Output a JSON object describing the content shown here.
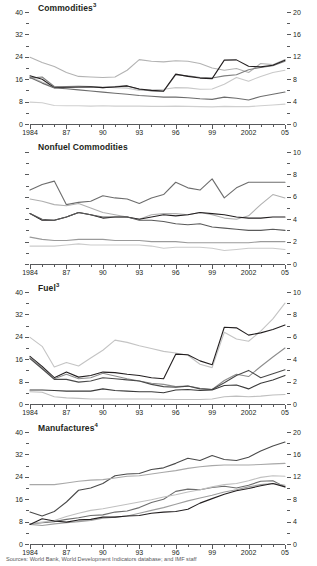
{
  "figure": {
    "source": "Sources: World Bank, World Development Indicators database; and IMF staff"
  },
  "xaxis": {
    "labels": [
      "1984",
      "87",
      "90",
      "93",
      "96",
      "99",
      "2002",
      "05"
    ],
    "label_years": [
      1984,
      1987,
      1990,
      1993,
      1996,
      1999,
      2002,
      2005
    ],
    "min": 1984,
    "max": 2005
  },
  "chart_data": [
    {
      "type": "line",
      "title": "Commodities",
      "title_superscript": "3",
      "xlabel": "",
      "ylabel_left": "",
      "ylabel_right": "",
      "x": [
        1984,
        1985,
        1986,
        1987,
        1988,
        1989,
        1990,
        1991,
        1992,
        1993,
        1994,
        1995,
        1996,
        1997,
        1998,
        1999,
        2000,
        2001,
        2002,
        2003,
        2004,
        2005
      ],
      "ylim_left": [
        0,
        40
      ],
      "yticks_left": [
        0,
        8,
        16,
        24,
        32,
        40
      ],
      "ylim_right": [
        0,
        20
      ],
      "yticks_right": [
        0,
        4,
        8,
        12,
        16,
        20
      ],
      "grid": false,
      "legend": "none",
      "series": [
        {
          "name": "series-1",
          "color": "#b3b3b3",
          "axis": "left",
          "values": [
            23.8,
            22.0,
            20.5,
            18.4,
            17.0,
            16.8,
            16.6,
            16.8,
            19.2,
            23.0,
            22.4,
            22.2,
            22.6,
            22.4,
            21.6,
            20.0,
            19.2,
            19.8,
            18.4,
            21.6,
            21.2,
            23.0
          ]
        },
        {
          "name": "series-2",
          "color": "#c9c9c9",
          "axis": "left",
          "values": [
            17.0,
            15.0,
            13.2,
            13.4,
            13.6,
            13.4,
            13.2,
            13.0,
            12.8,
            12.0,
            12.2,
            12.4,
            13.0,
            12.9,
            12.4,
            12.5,
            14.2,
            16.6,
            15.3,
            17.0,
            18.4,
            19.2
          ]
        },
        {
          "name": "series-3",
          "color": "#7f7f7f",
          "axis": "left",
          "values": [
            16.4,
            16.8,
            13.4,
            13.0,
            13.2,
            13.2,
            13.0,
            13.4,
            13.6,
            12.4,
            11.8,
            11.6,
            17.6,
            17.2,
            16.6,
            16.4,
            17.2,
            17.6,
            19.4,
            20.2,
            20.8,
            22.4
          ]
        },
        {
          "name": "series-4",
          "color": "#231f20",
          "axis": "left",
          "values": [
            17.2,
            16.0,
            13.0,
            13.2,
            13.2,
            13.3,
            13.0,
            13.2,
            13.6,
            12.5,
            12.0,
            11.8,
            17.8,
            17.0,
            16.4,
            16.2,
            22.8,
            22.9,
            20.6,
            20.4,
            21.0,
            22.8
          ]
        },
        {
          "name": "series-5",
          "color": "#6d6d6d",
          "axis": "left",
          "values": [
            16.6,
            14.6,
            12.9,
            12.6,
            12.2,
            11.8,
            11.4,
            11.0,
            10.6,
            10.2,
            9.9,
            9.6,
            9.6,
            9.4,
            9.0,
            8.8,
            9.6,
            9.2,
            8.6,
            9.8,
            10.6,
            11.4
          ]
        },
        {
          "name": "series-6",
          "color": "#cfcfcf",
          "axis": "left",
          "values": [
            7.8,
            7.6,
            6.6,
            6.5,
            6.5,
            6.4,
            6.5,
            6.4,
            6.4,
            6.4,
            6.3,
            6.3,
            6.4,
            6.3,
            6.2,
            6.1,
            6.3,
            6.2,
            6.2,
            6.5,
            6.8,
            7.1
          ]
        }
      ]
    },
    {
      "type": "line",
      "title": "Nonfuel Commodities",
      "title_superscript": "",
      "xlabel": "",
      "ylabel_left": "",
      "ylabel_right": "",
      "x": [
        1984,
        1985,
        1986,
        1987,
        1988,
        1989,
        1990,
        1991,
        1992,
        1993,
        1994,
        1995,
        1996,
        1997,
        1998,
        1999,
        2000,
        2001,
        2002,
        2003,
        2004,
        2005
      ],
      "ylim_left": [
        0,
        10
      ],
      "yticks_left": [
        0,
        2,
        4,
        6,
        8,
        10
      ],
      "ylim_right": [
        0,
        10
      ],
      "yticks_right": [
        0,
        2,
        4,
        6,
        8,
        10
      ],
      "grid": false,
      "legend": "none",
      "series": [
        {
          "name": "series-1",
          "color": "#6d6d6d",
          "axis": "left",
          "values": [
            6.6,
            7.1,
            7.4,
            5.3,
            5.5,
            5.6,
            6.1,
            5.9,
            5.8,
            5.4,
            5.9,
            6.2,
            7.3,
            6.8,
            6.6,
            7.6,
            5.9,
            6.8,
            7.3,
            7.3,
            7.3,
            7.3
          ]
        },
        {
          "name": "series-2",
          "color": "#b0b0b0",
          "axis": "left",
          "values": [
            5.8,
            5.6,
            5.3,
            5.2,
            5.4,
            5.0,
            4.6,
            4.4,
            4.2,
            4.0,
            4.4,
            4.5,
            4.5,
            4.4,
            4.6,
            4.4,
            4.1,
            4.0,
            4.3,
            5.3,
            6.2,
            5.9
          ]
        },
        {
          "name": "series-3",
          "color": "#231f20",
          "axis": "left",
          "values": [
            4.5,
            3.9,
            3.9,
            4.2,
            4.6,
            4.4,
            4.1,
            4.2,
            4.2,
            4.0,
            4.2,
            4.4,
            4.3,
            4.4,
            4.6,
            4.5,
            4.4,
            4.2,
            4.1,
            4.1,
            4.2,
            4.2
          ]
        },
        {
          "name": "series-4",
          "color": "#5a5a5a",
          "axis": "left",
          "values": [
            4.5,
            4.0,
            3.9,
            4.2,
            4.6,
            4.4,
            4.2,
            4.2,
            4.2,
            3.9,
            3.9,
            3.8,
            3.6,
            3.5,
            3.6,
            3.3,
            3.2,
            3.1,
            3.0,
            3.0,
            3.1,
            3.0
          ]
        },
        {
          "name": "series-5",
          "color": "#9a9a9a",
          "axis": "left",
          "values": [
            2.4,
            2.2,
            2.1,
            2.1,
            2.2,
            2.2,
            2.2,
            2.1,
            2.1,
            2.1,
            2.0,
            2.0,
            2.0,
            1.9,
            1.9,
            1.9,
            1.9,
            1.9,
            1.9,
            2.0,
            2.0,
            2.0
          ]
        },
        {
          "name": "series-6",
          "color": "#cbcbcb",
          "axis": "left",
          "values": [
            1.6,
            1.6,
            1.6,
            1.7,
            1.8,
            1.7,
            1.7,
            1.7,
            1.7,
            1.7,
            1.6,
            1.4,
            1.5,
            1.5,
            1.5,
            1.4,
            1.2,
            1.3,
            1.4,
            1.4,
            1.4,
            1.3
          ]
        }
      ]
    },
    {
      "type": "line",
      "title": "Fuel",
      "title_superscript": "3",
      "xlabel": "",
      "ylabel_left": "",
      "ylabel_right": "",
      "x": [
        1984,
        1985,
        1986,
        1987,
        1988,
        1989,
        1990,
        1991,
        1992,
        1993,
        1994,
        1995,
        1996,
        1997,
        1998,
        1999,
        2000,
        2001,
        2002,
        2003,
        2004,
        2005
      ],
      "ylim_left": [
        0,
        40
      ],
      "yticks_left": [
        0,
        8,
        16,
        24,
        32,
        40
      ],
      "ylim_right": [
        0,
        10
      ],
      "yticks_right": [
        0,
        2,
        4,
        6,
        8,
        10
      ],
      "grid": false,
      "legend": "none",
      "series": [
        {
          "name": "series-1",
          "color": "#c4c4c4",
          "axis": "left",
          "values": [
            23.8,
            20.6,
            13.2,
            14.8,
            13.6,
            16.4,
            19.2,
            22.8,
            22.0,
            20.8,
            19.8,
            18.8,
            18.2,
            17.4,
            14.2,
            13.0,
            25.6,
            23.2,
            22.4,
            26.0,
            30.4,
            36.0
          ]
        },
        {
          "name": "series-2",
          "color": "#231f20",
          "axis": "left",
          "values": [
            17.0,
            13.4,
            9.4,
            11.4,
            9.6,
            10.2,
            11.4,
            11.2,
            10.6,
            10.2,
            9.4,
            9.0,
            17.8,
            17.6,
            15.4,
            14.0,
            27.4,
            27.2,
            24.6,
            25.4,
            26.6,
            28.2
          ]
        },
        {
          "name": "series-3",
          "color": "#8d8d8d",
          "axis": "left",
          "values": [
            16.6,
            13.0,
            9.0,
            10.6,
            9.0,
            9.4,
            11.0,
            10.0,
            9.0,
            8.2,
            7.4,
            7.0,
            6.2,
            6.4,
            5.6,
            5.2,
            8.4,
            10.6,
            9.8,
            13.4,
            16.8,
            20.0
          ]
        },
        {
          "name": "series-4",
          "color": "#4a4a4a",
          "axis": "left",
          "values": [
            16.2,
            12.6,
            8.8,
            8.8,
            7.8,
            8.2,
            9.4,
            9.0,
            8.6,
            8.2,
            7.0,
            6.2,
            6.0,
            6.4,
            5.4,
            5.2,
            7.6,
            10.2,
            12.0,
            9.4,
            10.8,
            12.2
          ]
        },
        {
          "name": "series-5",
          "color": "#3a3a3a",
          "axis": "left",
          "values": [
            5.0,
            5.0,
            4.8,
            4.6,
            4.6,
            4.6,
            5.4,
            4.8,
            4.6,
            4.4,
            4.4,
            4.0,
            5.0,
            5.2,
            4.8,
            5.0,
            6.6,
            6.8,
            5.4,
            7.4,
            8.6,
            10.2
          ]
        },
        {
          "name": "series-6",
          "color": "#bfbfbf",
          "axis": "left",
          "values": [
            4.4,
            4.2,
            2.6,
            2.2,
            2.0,
            1.8,
            1.8,
            1.8,
            1.8,
            1.8,
            1.8,
            1.7,
            1.6,
            1.6,
            1.6,
            1.8,
            2.6,
            2.8,
            2.6,
            2.8,
            3.2,
            3.4
          ]
        }
      ]
    },
    {
      "type": "line",
      "title": "Manufactures",
      "title_superscript": "4",
      "xlabel": "",
      "ylabel_left": "",
      "ylabel_right": "",
      "x": [
        1984,
        1985,
        1986,
        1987,
        1988,
        1989,
        1990,
        1991,
        1992,
        1993,
        1994,
        1995,
        1996,
        1997,
        1998,
        1999,
        2000,
        2001,
        2002,
        2003,
        2004,
        2005
      ],
      "ylim_left": [
        0,
        40
      ],
      "yticks_left": [
        0,
        8,
        16,
        24,
        32,
        40
      ],
      "ylim_right": [
        0,
        20
      ],
      "yticks_right": [
        0,
        4,
        8,
        12,
        16,
        20
      ],
      "grid": false,
      "legend": "none",
      "series": [
        {
          "name": "series-1",
          "color": "#4a4a4a",
          "axis": "left",
          "values": [
            11.4,
            10.0,
            11.6,
            15.0,
            19.2,
            20.0,
            21.6,
            24.4,
            25.0,
            25.2,
            26.6,
            27.2,
            28.8,
            30.6,
            29.8,
            31.6,
            30.2,
            29.8,
            31.0,
            33.2,
            35.0,
            36.4
          ]
        },
        {
          "name": "series-2",
          "color": "#a8a8a8",
          "axis": "left",
          "values": [
            21.2,
            21.2,
            21.2,
            21.8,
            22.4,
            22.8,
            23.0,
            23.6,
            24.2,
            24.4,
            25.0,
            25.6,
            26.2,
            27.0,
            27.6,
            28.0,
            28.2,
            28.2,
            28.2,
            28.4,
            28.6,
            28.8
          ]
        },
        {
          "name": "series-3",
          "color": "#6d6d6d",
          "axis": "left",
          "values": [
            7.2,
            7.6,
            8.0,
            8.8,
            9.4,
            10.2,
            10.4,
            11.4,
            11.8,
            13.0,
            14.8,
            16.0,
            18.8,
            19.6,
            19.4,
            20.2,
            20.6,
            20.0,
            21.0,
            22.4,
            22.6,
            20.4
          ]
        },
        {
          "name": "series-4",
          "color": "#c0c0c0",
          "axis": "left",
          "values": [
            7.2,
            7.8,
            8.4,
            9.8,
            11.0,
            12.0,
            12.6,
            13.4,
            14.2,
            15.0,
            15.8,
            16.8,
            17.6,
            18.6,
            19.4,
            20.4,
            21.2,
            21.6,
            22.6,
            23.8,
            24.4,
            24.2
          ]
        },
        {
          "name": "series-5",
          "color": "#9e9e9e",
          "axis": "left",
          "values": [
            7.0,
            6.6,
            7.2,
            7.6,
            8.0,
            8.4,
            9.2,
            9.6,
            10.0,
            11.0,
            12.0,
            13.0,
            14.2,
            15.4,
            16.4,
            17.4,
            18.6,
            19.4,
            20.4,
            21.2,
            21.6,
            21.0
          ]
        },
        {
          "name": "series-6",
          "color": "#231f20",
          "axis": "left",
          "values": [
            7.0,
            9.0,
            8.2,
            7.8,
            8.6,
            8.8,
            9.6,
            9.6,
            10.0,
            10.2,
            11.0,
            11.4,
            11.6,
            12.4,
            14.6,
            16.2,
            17.8,
            19.0,
            19.8,
            20.8,
            21.6,
            20.4
          ]
        }
      ]
    }
  ]
}
